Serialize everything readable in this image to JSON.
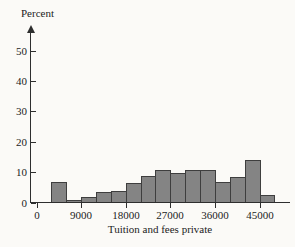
{
  "figure": {
    "background": "#fbfaf7"
  },
  "chart_data": {
    "type": "bar",
    "subtype": "histogram",
    "title": "",
    "xlabel": "Tuition and fees private",
    "ylabel": "Percent",
    "grid": false,
    "legend": "none",
    "xlim": [
      0,
      48000
    ],
    "ylim": [
      0,
      55
    ],
    "x_ticks": [
      0,
      9000,
      18000,
      27000,
      36000,
      45000
    ],
    "x_tick_labels": [
      "0",
      "9000",
      "18000",
      "27000",
      "36000",
      "45000"
    ],
    "y_ticks": [
      0,
      10,
      20,
      30,
      40,
      50
    ],
    "y_tick_labels": [
      "0",
      "10",
      "20",
      "30",
      "40",
      "50"
    ],
    "bin_width": 3000,
    "bins": [
      {
        "start": 0,
        "end": 3000,
        "percent": 0
      },
      {
        "start": 3000,
        "end": 6000,
        "percent": 7
      },
      {
        "start": 6000,
        "end": 9000,
        "percent": 1
      },
      {
        "start": 9000,
        "end": 12000,
        "percent": 2
      },
      {
        "start": 12000,
        "end": 15000,
        "percent": 3.5
      },
      {
        "start": 15000,
        "end": 18000,
        "percent": 4
      },
      {
        "start": 18000,
        "end": 21000,
        "percent": 6.5
      },
      {
        "start": 21000,
        "end": 24000,
        "percent": 9
      },
      {
        "start": 24000,
        "end": 27000,
        "percent": 11
      },
      {
        "start": 27000,
        "end": 30000,
        "percent": 10
      },
      {
        "start": 30000,
        "end": 33000,
        "percent": 11
      },
      {
        "start": 33000,
        "end": 36000,
        "percent": 11
      },
      {
        "start": 36000,
        "end": 39000,
        "percent": 7
      },
      {
        "start": 39000,
        "end": 42000,
        "percent": 8.5
      },
      {
        "start": 42000,
        "end": 45000,
        "percent": 14
      },
      {
        "start": 45000,
        "end": 48000,
        "percent": 2.5
      }
    ],
    "colors": {
      "bar_fill": "#848484",
      "bar_border": "#3e3e3e",
      "axis": "#2e2e2e",
      "text": "#1c1c1c"
    }
  }
}
